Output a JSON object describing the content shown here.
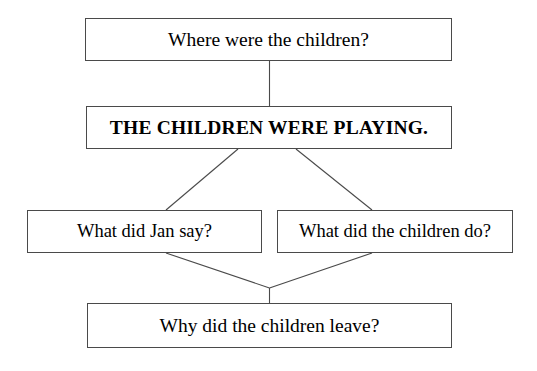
{
  "diagram": {
    "background_color": "#ffffff",
    "box_border_color": "#4a4a4a",
    "connector_color": "#4a4a4a",
    "text_color": "#000000",
    "nodes": [
      {
        "id": "question-location",
        "label": "Where were the children?",
        "role": "question",
        "emphasis": "normal"
      },
      {
        "id": "statement-playing",
        "label": "THE CHILDREN WERE PLAYING.",
        "role": "statement",
        "emphasis": "bold"
      },
      {
        "id": "question-jan-say",
        "label": "What did Jan say?",
        "role": "question",
        "emphasis": "normal"
      },
      {
        "id": "question-children-do",
        "label": "What did the children do?",
        "role": "question",
        "emphasis": "normal"
      },
      {
        "id": "question-children-leave",
        "label": "Why did the children leave?",
        "role": "question",
        "emphasis": "normal"
      }
    ],
    "edges": [
      {
        "from": "question-location",
        "to": "statement-playing",
        "kind": "vertical"
      },
      {
        "from": "statement-playing",
        "to": "question-jan-say",
        "kind": "diagonal"
      },
      {
        "from": "statement-playing",
        "to": "question-children-do",
        "kind": "diagonal"
      },
      {
        "from": "question-jan-say",
        "to": "question-children-leave",
        "kind": "diagonal-merge"
      },
      {
        "from": "question-children-do",
        "to": "question-children-leave",
        "kind": "diagonal-merge"
      }
    ]
  }
}
